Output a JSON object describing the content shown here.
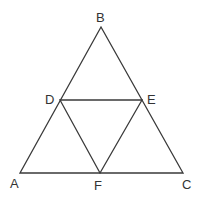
{
  "diagram": {
    "points": {
      "A": {
        "label": "A",
        "x": 20,
        "y": 173
      },
      "B": {
        "label": "B",
        "x": 101,
        "y": 27
      },
      "C": {
        "label": "C",
        "x": 183,
        "y": 173
      },
      "D": {
        "label": "D",
        "x": 60,
        "y": 100
      },
      "E": {
        "label": "E",
        "x": 142,
        "y": 100
      },
      "F": {
        "label": "F",
        "x": 100,
        "y": 173
      }
    },
    "segments": [
      "AB",
      "BC",
      "CA",
      "DE",
      "DF",
      "EF"
    ],
    "line_color": "#3a3a3a"
  }
}
